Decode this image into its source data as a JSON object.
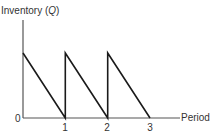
{
  "chart_data": {
    "type": "line",
    "title": "",
    "ylabel": "Inventory (Q)",
    "ylabel_parts": {
      "prefix": "Inventory (",
      "var": "Q",
      "suffix": ")"
    },
    "xlabel": "Period",
    "x_ticks": [
      "0",
      "1",
      "2",
      "3"
    ],
    "xlim": [
      0,
      3
    ],
    "ylim": [
      0,
      1
    ],
    "grid": false,
    "legend": "none",
    "series": [
      {
        "name": "Inventory",
        "points": [
          {
            "x": 0,
            "y": 1
          },
          {
            "x": 1,
            "y": 0
          },
          {
            "x": 1,
            "y": 1
          },
          {
            "x": 2,
            "y": 0
          },
          {
            "x": 2,
            "y": 1
          },
          {
            "x": 3,
            "y": 0
          }
        ]
      }
    ]
  },
  "colors": {
    "line": "#1a1a1a",
    "axis": "#555555",
    "text": "#333333"
  }
}
